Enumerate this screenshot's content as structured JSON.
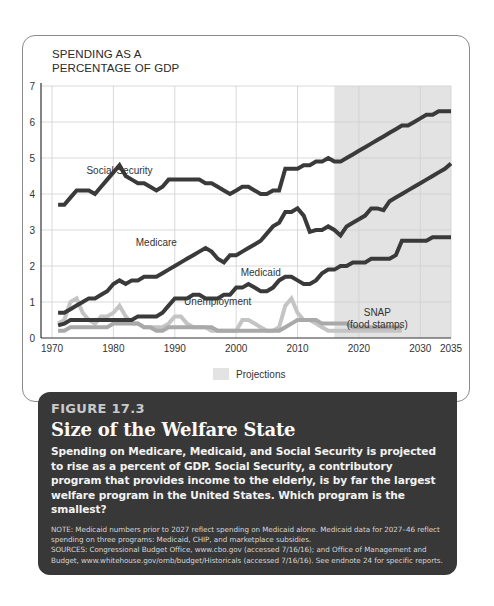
{
  "chart_data": {
    "type": "line",
    "title": "SPENDING AS A PERCENTAGE OF GDP",
    "title_lines": [
      "SPENDING AS A",
      "PERCENTAGE  OF GDP"
    ],
    "xlabel": "",
    "ylabel": "",
    "xlim": [
      1970,
      2035
    ],
    "ylim": [
      0,
      7
    ],
    "x_ticks": [
      1970,
      1980,
      1990,
      2000,
      2010,
      2020,
      2030,
      2035
    ],
    "y_ticks": [
      0,
      1,
      2,
      3,
      4,
      5,
      6,
      7
    ],
    "grid": true,
    "projection_start": 2016,
    "projection_end": 2035,
    "legend": [
      {
        "label": "Projections",
        "color": "#e3e3e3"
      }
    ],
    "series": [
      {
        "name": "Social Security",
        "color": "#3a3a3a",
        "label_pos": [
          1981,
          4.55
        ],
        "x": [
          1971,
          1972,
          1973,
          1974,
          1975,
          1976,
          1977,
          1978,
          1979,
          1980,
          1981,
          1982,
          1983,
          1984,
          1985,
          1986,
          1987,
          1988,
          1989,
          1990,
          1991,
          1992,
          1993,
          1994,
          1995,
          1996,
          1997,
          1998,
          1999,
          2000,
          2001,
          2002,
          2003,
          2004,
          2005,
          2006,
          2007,
          2008,
          2009,
          2010,
          2011,
          2012,
          2013,
          2014,
          2015,
          2016,
          2017,
          2018,
          2019,
          2020,
          2021,
          2022,
          2023,
          2024,
          2025,
          2026,
          2027,
          2028,
          2029,
          2030,
          2031,
          2032,
          2033,
          2034,
          2035
        ],
        "values": [
          3.7,
          3.7,
          3.9,
          4.1,
          4.1,
          4.1,
          4.0,
          4.2,
          4.4,
          4.6,
          4.8,
          4.5,
          4.4,
          4.3,
          4.3,
          4.2,
          4.1,
          4.2,
          4.4,
          4.4,
          4.4,
          4.4,
          4.4,
          4.4,
          4.3,
          4.3,
          4.2,
          4.1,
          4.0,
          4.1,
          4.2,
          4.2,
          4.1,
          4.0,
          4.0,
          4.1,
          4.1,
          4.7,
          4.7,
          4.7,
          4.8,
          4.8,
          4.9,
          4.9,
          5.0,
          4.9,
          4.9,
          5.0,
          5.1,
          5.2,
          5.3,
          5.4,
          5.5,
          5.6,
          5.7,
          5.8,
          5.9,
          5.9,
          6.0,
          6.1,
          6.2,
          6.2,
          6.3,
          6.3,
          6.3
        ]
      },
      {
        "name": "Medicare",
        "color": "#3a3a3a",
        "label_pos": [
          1987,
          2.55
        ],
        "x": [
          1971,
          1972,
          1973,
          1974,
          1975,
          1976,
          1977,
          1978,
          1979,
          1980,
          1981,
          1982,
          1983,
          1984,
          1985,
          1986,
          1987,
          1988,
          1989,
          1990,
          1991,
          1992,
          1993,
          1994,
          1995,
          1996,
          1997,
          1998,
          1999,
          2000,
          2001,
          2002,
          2003,
          2004,
          2005,
          2006,
          2007,
          2008,
          2009,
          2010,
          2011,
          2012,
          2013,
          2014,
          2015,
          2016,
          2017,
          2018,
          2019,
          2020,
          2021,
          2022,
          2023,
          2024,
          2025,
          2026,
          2027,
          2028,
          2029,
          2030,
          2031,
          2032,
          2033,
          2034,
          2035
        ],
        "values": [
          0.7,
          0.7,
          0.8,
          0.9,
          1.0,
          1.1,
          1.1,
          1.2,
          1.3,
          1.5,
          1.6,
          1.5,
          1.6,
          1.6,
          1.7,
          1.7,
          1.7,
          1.8,
          1.9,
          2.0,
          2.1,
          2.2,
          2.3,
          2.4,
          2.5,
          2.4,
          2.2,
          2.1,
          2.3,
          2.3,
          2.4,
          2.5,
          2.6,
          2.7,
          2.9,
          3.1,
          3.2,
          3.5,
          3.5,
          3.6,
          3.4,
          2.95,
          3.0,
          3.0,
          3.1,
          3.0,
          2.85,
          3.1,
          3.2,
          3.3,
          3.4,
          3.6,
          3.6,
          3.55,
          3.8,
          3.9,
          4.0,
          4.1,
          4.2,
          4.3,
          4.4,
          4.5,
          4.6,
          4.7,
          4.85
        ]
      },
      {
        "name": "Medicaid",
        "color": "#3a3a3a",
        "label_pos": [
          2004,
          1.72
        ],
        "x": [
          1971,
          1972,
          1973,
          1974,
          1975,
          1976,
          1977,
          1978,
          1979,
          1980,
          1981,
          1982,
          1983,
          1984,
          1985,
          1986,
          1987,
          1988,
          1989,
          1990,
          1991,
          1992,
          1993,
          1994,
          1995,
          1996,
          1997,
          1998,
          1999,
          2000,
          2001,
          2002,
          2003,
          2004,
          2005,
          2006,
          2007,
          2008,
          2009,
          2010,
          2011,
          2012,
          2013,
          2014,
          2015,
          2016,
          2017,
          2018,
          2019,
          2020,
          2021,
          2022,
          2023,
          2024,
          2025,
          2026,
          2027,
          2028,
          2029,
          2030,
          2031,
          2032,
          2033,
          2034,
          2035
        ],
        "values": [
          0.35,
          0.4,
          0.5,
          0.5,
          0.5,
          0.5,
          0.5,
          0.5,
          0.5,
          0.5,
          0.5,
          0.5,
          0.5,
          0.6,
          0.6,
          0.6,
          0.6,
          0.7,
          0.9,
          1.1,
          1.1,
          1.1,
          1.2,
          1.2,
          1.1,
          1.1,
          1.1,
          1.2,
          1.2,
          1.4,
          1.4,
          1.5,
          1.4,
          1.3,
          1.3,
          1.4,
          1.6,
          1.7,
          1.7,
          1.6,
          1.5,
          1.5,
          1.6,
          1.8,
          1.9,
          1.9,
          2.0,
          2.0,
          2.1,
          2.1,
          2.1,
          2.2,
          2.2,
          2.2,
          2.2,
          2.3,
          2.7,
          2.7,
          2.7,
          2.7,
          2.7,
          2.8,
          2.8,
          2.8,
          2.8
        ]
      },
      {
        "name": "Unemployment",
        "color": "#c4c4c4",
        "label_pos": [
          1997,
          0.92
        ],
        "x": [
          1971,
          1972,
          1973,
          1974,
          1975,
          1976,
          1977,
          1978,
          1979,
          1980,
          1981,
          1982,
          1983,
          1984,
          1985,
          1986,
          1987,
          1988,
          1989,
          1990,
          1991,
          1992,
          1993,
          1994,
          1995,
          1996,
          1997,
          1998,
          1999,
          2000,
          2001,
          2002,
          2003,
          2004,
          2005,
          2006,
          2007,
          2008,
          2009,
          2010,
          2011,
          2012,
          2013,
          2014,
          2015,
          2016,
          2017,
          2018,
          2019,
          2020,
          2021,
          2022,
          2023,
          2024,
          2025,
          2026,
          2027
        ],
        "values": [
          0.4,
          0.5,
          1.0,
          1.1,
          0.7,
          0.5,
          0.4,
          0.6,
          0.6,
          0.7,
          0.9,
          0.6,
          0.4,
          0.4,
          0.3,
          0.3,
          0.3,
          0.3,
          0.4,
          0.6,
          0.6,
          0.4,
          0.3,
          0.3,
          0.3,
          0.2,
          0.2,
          0.2,
          0.2,
          0.2,
          0.5,
          0.5,
          0.4,
          0.3,
          0.2,
          0.2,
          0.3,
          0.9,
          1.1,
          0.7,
          0.5,
          0.5,
          0.4,
          0.3,
          0.2,
          0.2,
          0.2,
          0.2,
          0.2,
          0.2,
          0.2,
          0.2,
          0.2,
          0.2,
          0.2,
          0.2,
          0.2
        ]
      },
      {
        "name": "SNAP (food stamps)",
        "color": "#a9a9a9",
        "label_lines": [
          "SNAP",
          "(food stamps)"
        ],
        "label_pos": [
          2023,
          0.62
        ],
        "x": [
          1971,
          1972,
          1973,
          1974,
          1975,
          1976,
          1977,
          1978,
          1979,
          1980,
          1981,
          1982,
          1983,
          1984,
          1985,
          1986,
          1987,
          1988,
          1989,
          1990,
          1991,
          1992,
          1993,
          1994,
          1995,
          1996,
          1997,
          1998,
          1999,
          2000,
          2001,
          2002,
          2003,
          2004,
          2005,
          2006,
          2007,
          2008,
          2009,
          2010,
          2011,
          2012,
          2013,
          2014,
          2015,
          2016,
          2017,
          2018,
          2019,
          2020,
          2021,
          2022,
          2023,
          2024,
          2025,
          2026,
          2027
        ],
        "values": [
          0.2,
          0.2,
          0.3,
          0.3,
          0.3,
          0.3,
          0.3,
          0.3,
          0.3,
          0.4,
          0.4,
          0.4,
          0.4,
          0.4,
          0.3,
          0.3,
          0.2,
          0.2,
          0.3,
          0.3,
          0.3,
          0.3,
          0.3,
          0.3,
          0.3,
          0.3,
          0.2,
          0.2,
          0.2,
          0.2,
          0.2,
          0.2,
          0.2,
          0.2,
          0.2,
          0.2,
          0.2,
          0.3,
          0.4,
          0.5,
          0.5,
          0.5,
          0.5,
          0.4,
          0.4,
          0.4,
          0.4,
          0.4,
          0.3,
          0.3,
          0.3,
          0.3,
          0.3,
          0.3,
          0.3,
          0.3,
          0.3
        ]
      }
    ]
  },
  "caption": {
    "figure_number": "FIGURE 17.3",
    "title": "Size of the Welfare State",
    "description": "Spending on Medicare, Medicaid, and Social Security is projected to rise as a percent of GDP. Social Security, a contributory program that provides income to the elderly, is by far the largest welfare program in the United States. Which program is the smallest?",
    "note": "NOTE: Medicaid numbers prior to 2027 reflect spending on Medicaid alone. Medicaid data for 2027–46 reflect spending on three programs: Medicaid, CHIP, and marketplace subsidies.",
    "sources": "SOURCES: Congressional Budget Office, www.cbo.gov (accessed 7/16/16); and Office of Management and Budget, www.whitehouse.gov/omb/budget/Historicals (accessed 7/16/16). See endnote 24 for specific reports."
  }
}
